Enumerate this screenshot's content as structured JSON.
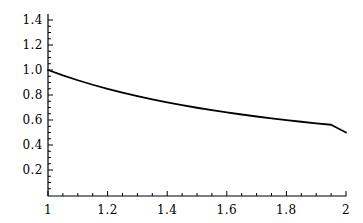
{
  "chart_data": {
    "type": "line",
    "title": "",
    "subtitle": "",
    "xlabel": "",
    "ylabel": "",
    "xlim": [
      1,
      2
    ],
    "ylim": [
      0,
      1.5
    ],
    "grid": false,
    "legend": null,
    "annotations": [],
    "axis_color": "#000000",
    "line_color": "#000000",
    "line_width": 1.8,
    "background_color": "#ffffff",
    "x_ticks": [
      {
        "value": 1,
        "label": "1"
      },
      {
        "value": 1.2,
        "label": "1.2"
      },
      {
        "value": 1.4,
        "label": "1.4"
      },
      {
        "value": 1.6,
        "label": "1.6"
      },
      {
        "value": 1.8,
        "label": "1.8"
      },
      {
        "value": 2,
        "label": "2"
      }
    ],
    "y_ticks": [
      {
        "value": 1.4,
        "label": "1.4"
      },
      {
        "value": 1.2,
        "label": "1.2"
      },
      {
        "value": 1.0,
        "label": "1.0"
      },
      {
        "value": 0.8,
        "label": "0.8"
      },
      {
        "value": 0.6,
        "label": "0.6"
      },
      {
        "value": 0.4,
        "label": "0.4"
      },
      {
        "value": 0.2,
        "label": "0.2"
      }
    ],
    "x_minor_ticks": [
      1.05,
      1.1,
      1.15,
      1.25,
      1.3,
      1.35,
      1.45,
      1.5,
      1.55,
      1.65,
      1.7,
      1.75,
      1.85,
      1.9,
      1.95
    ],
    "y_minor_ticks": [
      0.05,
      0.1,
      0.15,
      0.25,
      0.3,
      0.35,
      0.45,
      0.5,
      0.55,
      0.65,
      0.7,
      0.75,
      0.85,
      0.9,
      0.95,
      1.05,
      1.1,
      1.15,
      1.25,
      1.3,
      1.35,
      1.45
    ],
    "series": [
      {
        "name": "curve",
        "x": [
          1.0,
          1.05,
          1.1,
          1.15,
          1.2,
          1.25,
          1.3,
          1.35,
          1.4,
          1.45,
          1.5,
          1.55,
          1.6,
          1.65,
          1.7,
          1.75,
          1.8,
          1.85,
          1.9,
          1.95,
          2.0
        ],
        "y": [
          1.0,
          0.957,
          0.918,
          0.882,
          0.849,
          0.819,
          0.791,
          0.765,
          0.741,
          0.719,
          0.698,
          0.679,
          0.661,
          0.644,
          0.628,
          0.613,
          0.599,
          0.586,
          0.573,
          0.562,
          0.5
        ]
      }
    ]
  },
  "geometry": {
    "width": 363,
    "height": 223,
    "x_axis_pixel_y": 196,
    "y_axis_pixel_x": 48,
    "x_pixel_at_xmin": 48,
    "x_pixel_at_xmax": 346,
    "y_pixel_at_0": 195,
    "y_pixel_per_unit": 125,
    "y_axis_top_pixel": 14,
    "major_tick_length": 5,
    "minor_tick_length": 3
  }
}
